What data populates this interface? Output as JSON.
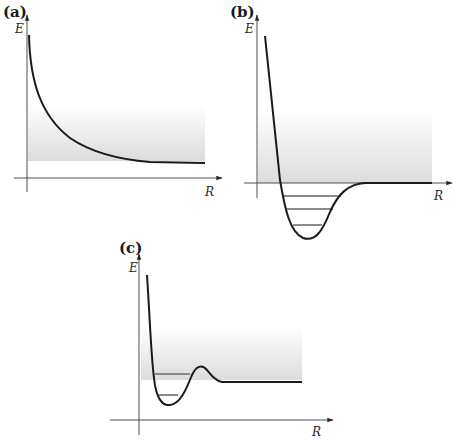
{
  "figure": {
    "colors": {
      "curve": "#1a1a1a",
      "axis": "#3a3a3a",
      "band_top": "#ffffff",
      "band_bottom": "#dcdcdc",
      "level": "#8a8a8a"
    },
    "panels": [
      {
        "id": "a",
        "label": "(a)",
        "y_axis_label": "E",
        "x_axis_label": "R",
        "curve_type": "repulsive",
        "bound_levels": 0
      },
      {
        "id": "b",
        "label": "(b)",
        "y_axis_label": "E",
        "x_axis_label": "R",
        "curve_type": "bound-well",
        "bound_levels": 3
      },
      {
        "id": "c",
        "label": "(c)",
        "y_axis_label": "E",
        "x_axis_label": "R",
        "curve_type": "quasi-bound-with-barrier",
        "bound_levels": 2
      }
    ]
  }
}
